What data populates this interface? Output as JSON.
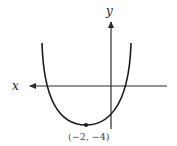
{
  "figure": {
    "x_axis_label": "x",
    "y_axis_label": "y",
    "vertex_label": "(−2, −4)",
    "curve": "upward-opening parabola",
    "vertex": {
      "x": -2,
      "y": -4
    },
    "colors": {
      "stroke": "#2a2a2a",
      "background": "#ffffff"
    }
  }
}
